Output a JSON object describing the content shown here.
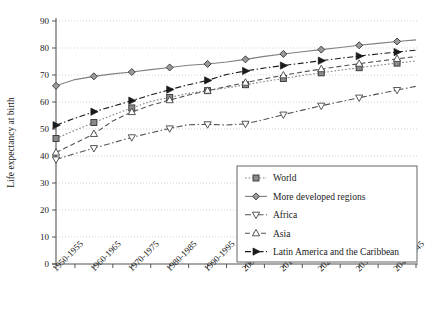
{
  "chart_data": {
    "type": "line",
    "title": "",
    "xlabel": "",
    "ylabel": "Life expectancy at birth",
    "ylim": [
      0,
      90
    ],
    "ytick_step": 10,
    "yticks": [
      0,
      10,
      20,
      30,
      40,
      50,
      60,
      70,
      80,
      90
    ],
    "grid": true,
    "grid_style": "dotted-horizontal",
    "legend_position": "inside-lower-right",
    "x": [
      "1950-1955",
      "1955-1960",
      "1960-1965",
      "1965-1970",
      "1970-1975",
      "1975-1980",
      "1980-1985",
      "1985-1990",
      "1990-1995",
      "1995-2000",
      "2000-2005",
      "2005-2010",
      "2010-2015",
      "2015-2020",
      "2020-2025",
      "2025-2030",
      "2030-2035",
      "2035-2040",
      "2040-2045",
      "2045-2050"
    ],
    "categories": [
      "1950-1955",
      "1955-1960",
      "1960-1965",
      "1965-1970",
      "1970-1975",
      "1975-1980",
      "1980-1985",
      "1985-1990",
      "1990-1995",
      "1995-2000",
      "2000-2005",
      "2005-2010",
      "2010-2015",
      "2015-2020",
      "2020-2025",
      "2025-2030",
      "2030-2035",
      "2035-2040",
      "2040-2045",
      "2045-2050"
    ],
    "xtick_labels_shown": [
      "1950-1955",
      "1960-1965",
      "1970-1975",
      "1980-1985",
      "1990-1995",
      "2000-2005",
      "2010-2015",
      "2020-2025",
      "2030-2035",
      "2040-2045"
    ],
    "series": [
      {
        "name": "World",
        "marker": "filled-square",
        "line": "dotted",
        "color": "#808080",
        "values": [
          46.5,
          49.5,
          52.4,
          55.2,
          57.8,
          60.2,
          61.7,
          63.2,
          64.2,
          65.2,
          66.4,
          67.6,
          68.7,
          69.8,
          70.8,
          71.8,
          72.7,
          73.6,
          74.4,
          75.2
        ]
      },
      {
        "name": "More developed regions",
        "marker": "filled-diamond",
        "line": "solid",
        "color": "#808080",
        "values": [
          66.0,
          68.3,
          69.5,
          70.4,
          71.1,
          72.0,
          72.8,
          73.6,
          74.1,
          74.8,
          75.8,
          76.9,
          77.8,
          78.6,
          79.4,
          80.2,
          81.0,
          81.7,
          82.4,
          83.0
        ]
      },
      {
        "name": "Africa",
        "marker": "open-down-triangle",
        "line": "dash-dot",
        "color": "#555555",
        "values": [
          38.7,
          40.9,
          42.9,
          44.9,
          46.9,
          48.6,
          50.2,
          51.6,
          51.7,
          51.5,
          51.9,
          53.5,
          55.3,
          57.0,
          58.6,
          60.1,
          61.6,
          63.0,
          64.4,
          65.8
        ]
      },
      {
        "name": "Asia",
        "marker": "open-up-triangle",
        "line": "dashed",
        "color": "#555555",
        "values": [
          41.3,
          44.7,
          48.2,
          53.0,
          56.3,
          58.8,
          60.7,
          62.6,
          64.2,
          65.7,
          67.2,
          68.6,
          69.9,
          71.1,
          72.2,
          73.2,
          74.2,
          75.1,
          76.0,
          76.8
        ]
      },
      {
        "name": "Latin America and the Caribbean",
        "marker": "filled-right-triangle",
        "line": "dash-dot",
        "color": "#1a1a1a",
        "values": [
          51.4,
          54.0,
          56.4,
          58.4,
          60.5,
          62.6,
          64.6,
          66.4,
          68.0,
          70.2,
          71.5,
          72.6,
          73.5,
          74.4,
          75.3,
          76.2,
          77.0,
          77.8,
          78.5,
          79.2
        ]
      }
    ]
  },
  "legend": {
    "entries": [
      {
        "label": "World"
      },
      {
        "label": "More developed regions"
      },
      {
        "label": "Africa"
      },
      {
        "label": "Asia"
      },
      {
        "label": "Latin America and the Caribbean"
      }
    ]
  },
  "colors": {
    "axis": "#555555",
    "grid": "#bbbbbb",
    "text": "#1a1a1a",
    "legend_border": "#555555",
    "background": "#ffffff"
  }
}
